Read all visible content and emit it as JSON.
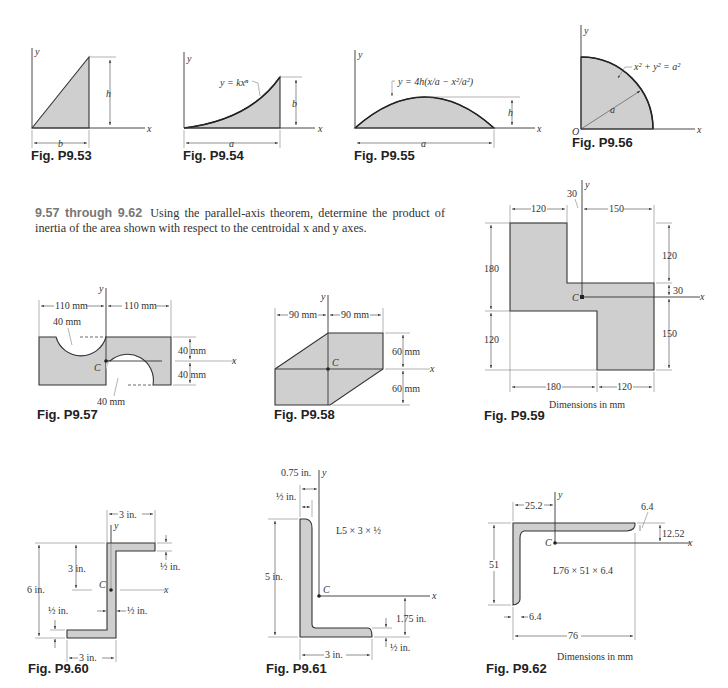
{
  "problem": {
    "number": "9.57 through 9.62",
    "text": "Using the parallel-axis theorem, determine the product of inertia of the area shown with respect to the centroidal x and y axes."
  },
  "colors": {
    "fill": "#cfcfcf",
    "ink": "#222222",
    "fig_label_gray": "#777777"
  },
  "figures": {
    "p953": {
      "caption": "Fig. P9.53",
      "y": "y",
      "x": "x",
      "h": "h",
      "b": "b"
    },
    "p954": {
      "caption": "Fig. P9.54",
      "y": "y",
      "x": "x",
      "eq": "y = kxⁿ",
      "b": "b",
      "a": "a"
    },
    "p955": {
      "caption": "Fig. P9.55",
      "y": "y",
      "x": "x",
      "eq": "y = 4h(x/a − x²/a²)",
      "h": "h",
      "a": "a"
    },
    "p956": {
      "caption": "Fig. P9.56",
      "y": "y",
      "x": "x",
      "origin": "O",
      "eq": "x² + y² = a²",
      "a": "a"
    },
    "p957": {
      "caption": "Fig. P9.57",
      "y": "y",
      "x": "x",
      "c": "C",
      "w_left": "110 mm",
      "w_right": "110 mm",
      "r_top": "40 mm",
      "r_bottom": "40 mm",
      "h_top": "40 mm",
      "h_bottom": "40 mm"
    },
    "p958": {
      "caption": "Fig. P9.58",
      "y": "y",
      "x": "x",
      "c": "C",
      "w_left": "90 mm",
      "w_right": "90 mm",
      "h_top": "60 mm",
      "h_bottom": "60 mm"
    },
    "p959": {
      "caption": "Fig. P9.59",
      "y": "y",
      "x": "x",
      "c": "C",
      "top_left": "120",
      "top_offset": "30",
      "top_right": "150",
      "left_upper": "180",
      "left_lower": "120",
      "right_upper": "120",
      "right_mid": "30",
      "right_lower": "150",
      "bottom_left": "180",
      "bottom_right": "120",
      "units": "Dimensions in mm"
    },
    "p960": {
      "caption": "Fig. P9.60",
      "y": "y",
      "x": "x",
      "c": "C",
      "top_width": "3 in.",
      "total_height": "6 in.",
      "half_height": "3 in.",
      "flange_top": "½ in.",
      "web": "½ in.",
      "flange_bottom": "½ in.",
      "bottom_width": "3 in."
    },
    "p961": {
      "caption": "Fig. P9.61",
      "y": "y",
      "x": "x",
      "c": "C",
      "offset": "0.75 in.",
      "thickness": "½ in.",
      "section": "L5 × 3 × ½",
      "height": "5 in.",
      "cy": "1.75 in.",
      "leg_t": "½ in.",
      "width": "3 in."
    },
    "p962": {
      "caption": "Fig. P9.62",
      "y": "y",
      "x": "x",
      "c": "C",
      "offset": "25.2",
      "t_top": "6.4",
      "cy": "12.52",
      "height": "51",
      "section": "L76 × 51 × 6.4",
      "t_leg": "6.4",
      "width": "76",
      "units": "Dimensions in mm"
    }
  }
}
